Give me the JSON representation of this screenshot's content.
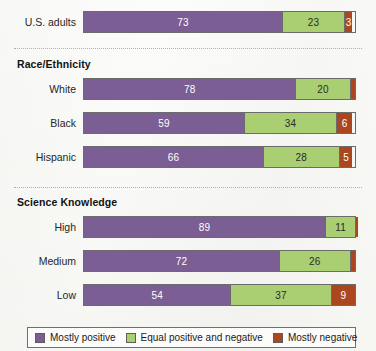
{
  "chart_data": {
    "type": "bar",
    "orientation": "horizontal",
    "stacked": true,
    "stack_total": 100,
    "title": "",
    "xlabel": "",
    "ylabel": "",
    "xlim": [
      0,
      100
    ],
    "grid": false,
    "legend_position": "bottom",
    "categories": [
      "U.S. adults",
      "White",
      "Black",
      "Hispanic",
      "High",
      "Medium",
      "Low"
    ],
    "series": [
      {
        "name": "Mostly positive",
        "color": "#7b5e93",
        "values": [
          73,
          78,
          59,
          66,
          89,
          72,
          54
        ]
      },
      {
        "name": "Equal positive and negative",
        "color": "#aace72",
        "values": [
          23,
          20,
          34,
          28,
          11,
          26,
          37
        ]
      },
      {
        "name": "Mostly negative",
        "color": "#ab471f",
        "values": [
          3,
          2,
          6,
          5,
          1,
          2,
          9
        ]
      }
    ],
    "groups": [
      {
        "header": "",
        "rows": [
          "U.S. adults"
        ]
      },
      {
        "header": "Race/Ethnicity",
        "rows": [
          "White",
          "Black",
          "Hispanic"
        ]
      },
      {
        "header": "Science Knowledge",
        "rows": [
          "High",
          "Medium",
          "Low"
        ]
      }
    ]
  },
  "sections": [
    {
      "header": null,
      "rows": [
        {
          "label": "U.S. adults",
          "segments": [
            {
              "key": "positive",
              "value": "73",
              "pct": 73,
              "inside": true
            },
            {
              "key": "neutral",
              "value": "23",
              "pct": 23,
              "inside": true
            },
            {
              "key": "negative",
              "value": "3",
              "pct": 3,
              "inside": true
            }
          ]
        }
      ]
    },
    {
      "header": "Race/Ethnicity",
      "rows": [
        {
          "label": "White",
          "segments": [
            {
              "key": "positive",
              "value": "78",
              "pct": 78,
              "inside": true
            },
            {
              "key": "neutral",
              "value": "20",
              "pct": 20,
              "inside": true
            },
            {
              "key": "negative",
              "value": "2",
              "pct": 2,
              "inside": false
            }
          ]
        },
        {
          "label": "Black",
          "segments": [
            {
              "key": "positive",
              "value": "59",
              "pct": 59,
              "inside": true
            },
            {
              "key": "neutral",
              "value": "34",
              "pct": 34,
              "inside": true
            },
            {
              "key": "negative",
              "value": "6",
              "pct": 6,
              "inside": true
            }
          ]
        },
        {
          "label": "Hispanic",
          "segments": [
            {
              "key": "positive",
              "value": "66",
              "pct": 66,
              "inside": true
            },
            {
              "key": "neutral",
              "value": "28",
              "pct": 28,
              "inside": true
            },
            {
              "key": "negative",
              "value": "5",
              "pct": 5,
              "inside": true
            }
          ]
        }
      ]
    },
    {
      "header": "Science Knowledge",
      "rows": [
        {
          "label": "High",
          "segments": [
            {
              "key": "positive",
              "value": "89",
              "pct": 89,
              "inside": true
            },
            {
              "key": "neutral",
              "value": "11",
              "pct": 11,
              "inside": true
            },
            {
              "key": "negative",
              "value": "1",
              "pct": 1,
              "inside": false
            }
          ]
        },
        {
          "label": "Medium",
          "segments": [
            {
              "key": "positive",
              "value": "72",
              "pct": 72,
              "inside": true
            },
            {
              "key": "neutral",
              "value": "26",
              "pct": 26,
              "inside": true
            },
            {
              "key": "negative",
              "value": "2",
              "pct": 2,
              "inside": false
            }
          ]
        },
        {
          "label": "Low",
          "segments": [
            {
              "key": "positive",
              "value": "54",
              "pct": 54,
              "inside": true
            },
            {
              "key": "neutral",
              "value": "37",
              "pct": 37,
              "inside": true
            },
            {
              "key": "negative",
              "value": "9",
              "pct": 9,
              "inside": true
            }
          ]
        }
      ]
    }
  ],
  "legend": {
    "items": [
      {
        "label": "Mostly positive",
        "color": "#7b5e93",
        "key": "positive"
      },
      {
        "label": "Equal positive and negative",
        "color": "#aace72",
        "key": "neutral"
      },
      {
        "label": "Mostly negative",
        "color": "#ab471f",
        "key": "negative"
      }
    ]
  },
  "colors": {
    "positive": "#7b5e93",
    "neutral": "#aace72",
    "negative": "#ab471f",
    "background": "#fbfbf9",
    "rule": "#9a9a9a",
    "text": "#1a1a1a"
  }
}
